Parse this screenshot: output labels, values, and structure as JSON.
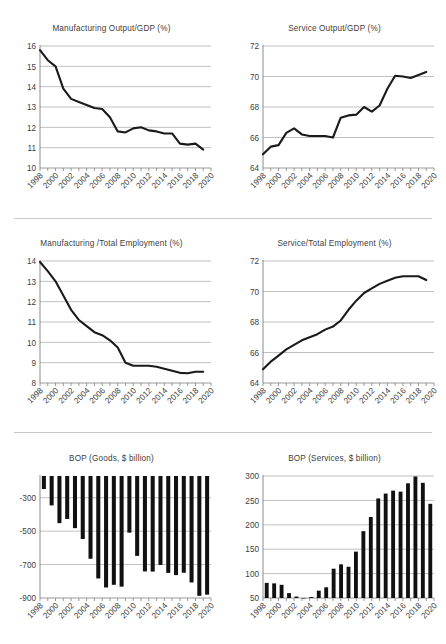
{
  "document": {
    "kind": "figure-panel",
    "panel_count": 6,
    "background_color": "#ffffff",
    "line_color": "#1a1a1a",
    "bar_color": "#111111",
    "grid_color": "#b0b0b0",
    "axis_color": "#808080",
    "text_color": "#404040"
  },
  "charts": [
    {
      "id": "manufacturing-output-gdp",
      "chart_data": {
        "type": "line",
        "title": "Manufacturing Output/GDP (%)",
        "xlabel": "",
        "ylabel": "",
        "ylim": [
          10,
          16
        ],
        "yticks": [
          10,
          11,
          12,
          13,
          14,
          15,
          16
        ],
        "ytick_labels": [
          "10",
          "11",
          "12",
          "13",
          "14",
          "15",
          "16"
        ],
        "xlim": [
          1998,
          2020
        ],
        "xticks": [
          1998,
          2000,
          2002,
          2004,
          2006,
          2008,
          2010,
          2012,
          2014,
          2016,
          2018,
          2020
        ],
        "xtick_labels": [
          "1998",
          "2000",
          "2002",
          "2004",
          "2006",
          "2008",
          "2010",
          "2012",
          "2014",
          "2016",
          "2018",
          "2020"
        ],
        "grid": "horizontal",
        "legend": "none",
        "x": [
          1998,
          1999,
          2000,
          2001,
          2002,
          2003,
          2004,
          2005,
          2006,
          2007,
          2008,
          2009,
          2010,
          2011,
          2012,
          2013,
          2014,
          2015,
          2016,
          2017,
          2018,
          2019
        ],
        "values": [
          15.8,
          15.3,
          15.0,
          13.9,
          13.4,
          13.25,
          13.1,
          12.95,
          12.9,
          12.5,
          11.8,
          11.75,
          11.95,
          12.0,
          11.85,
          11.8,
          11.7,
          11.7,
          11.2,
          11.15,
          11.2,
          10.9
        ]
      }
    },
    {
      "id": "service-output-gdp",
      "chart_data": {
        "type": "line",
        "title": "Service Output/GDP (%)",
        "xlabel": "",
        "ylabel": "",
        "ylim": [
          64,
          72
        ],
        "yticks": [
          64,
          66,
          68,
          70,
          72
        ],
        "ytick_labels": [
          "64",
          "66",
          "68",
          "70",
          "72"
        ],
        "xlim": [
          1998,
          2020
        ],
        "xticks": [
          1998,
          2000,
          2002,
          2004,
          2006,
          2008,
          2010,
          2012,
          2014,
          2016,
          2018,
          2020
        ],
        "xtick_labels": [
          "1998",
          "2000",
          "2002",
          "2004",
          "2006",
          "2008",
          "2010",
          "2012",
          "2014",
          "2016",
          "2018",
          "2020"
        ],
        "grid": "horizontal",
        "legend": "none",
        "x": [
          1998,
          1999,
          2000,
          2001,
          2002,
          2003,
          2004,
          2005,
          2006,
          2007,
          2008,
          2009,
          2010,
          2011,
          2012,
          2013,
          2014,
          2015,
          2016,
          2017,
          2018,
          2019
        ],
        "values": [
          64.9,
          65.4,
          65.5,
          66.3,
          66.6,
          66.2,
          66.1,
          66.1,
          66.1,
          66.0,
          67.3,
          67.45,
          67.5,
          68.0,
          67.7,
          68.1,
          69.2,
          70.05,
          70.0,
          69.9,
          70.1,
          70.3
        ]
      }
    },
    {
      "id": "manufacturing-total-employment",
      "chart_data": {
        "type": "line",
        "title": "Manufacturing /Total Employment (%)",
        "xlabel": "",
        "ylabel": "",
        "ylim": [
          8,
          14
        ],
        "yticks": [
          8,
          9,
          10,
          11,
          12,
          13,
          14
        ],
        "ytick_labels": [
          "8",
          "9",
          "10",
          "11",
          "12",
          "13",
          "14"
        ],
        "xlim": [
          1998,
          2020
        ],
        "xticks": [
          1998,
          2000,
          2002,
          2004,
          2006,
          2008,
          2010,
          2012,
          2014,
          2016,
          2018,
          2020
        ],
        "xtick_labels": [
          "1998",
          "2000",
          "2002",
          "2004",
          "2006",
          "2008",
          "2010",
          "2012",
          "2014",
          "2016",
          "2018",
          "2020"
        ],
        "grid": "horizontal",
        "legend": "none",
        "x": [
          1998,
          1999,
          2000,
          2001,
          2002,
          2003,
          2004,
          2005,
          2006,
          2007,
          2008,
          2009,
          2010,
          2011,
          2012,
          2013,
          2014,
          2015,
          2016,
          2017,
          2018,
          2019
        ],
        "values": [
          13.95,
          13.5,
          13.0,
          12.3,
          11.6,
          11.1,
          10.8,
          10.5,
          10.35,
          10.1,
          9.75,
          9.0,
          8.85,
          8.85,
          8.85,
          8.8,
          8.7,
          8.6,
          8.5,
          8.48,
          8.55,
          8.55
        ]
      }
    },
    {
      "id": "service-total-employment",
      "chart_data": {
        "type": "line",
        "title": "Service/Total Employment (%)",
        "xlabel": "",
        "ylabel": "",
        "ylim": [
          64,
          72
        ],
        "yticks": [
          64,
          66,
          68,
          70,
          72
        ],
        "ytick_labels": [
          "64",
          "66",
          "68",
          "70",
          "72"
        ],
        "xlim": [
          1998,
          2020
        ],
        "xticks": [
          1998,
          2000,
          2002,
          2004,
          2006,
          2008,
          2010,
          2012,
          2014,
          2016,
          2018,
          2020
        ],
        "xtick_labels": [
          "1998",
          "2000",
          "2002",
          "2004",
          "2006",
          "2008",
          "2010",
          "2012",
          "2014",
          "2016",
          "2018",
          "2020"
        ],
        "grid": "horizontal",
        "legend": "none",
        "x": [
          1998,
          1999,
          2000,
          2001,
          2002,
          2003,
          2004,
          2005,
          2006,
          2007,
          2008,
          2009,
          2010,
          2011,
          2012,
          2013,
          2014,
          2015,
          2016,
          2017,
          2018,
          2019
        ],
        "values": [
          64.9,
          65.4,
          65.8,
          66.2,
          66.5,
          66.8,
          67.0,
          67.2,
          67.5,
          67.7,
          68.1,
          68.8,
          69.4,
          69.9,
          70.2,
          70.5,
          70.7,
          70.9,
          71.0,
          71.0,
          71.0,
          70.75
        ]
      }
    },
    {
      "id": "bop-goods",
      "chart_data": {
        "type": "bar",
        "title": "BOP (Goods, $ billion)",
        "xlabel": "",
        "ylabel": "",
        "ylim": [
          -900,
          -170
        ],
        "yticks": [
          -900,
          -700,
          -500,
          -300
        ],
        "ytick_labels": [
          "-900",
          "-700",
          "-500",
          "-300"
        ],
        "grid": "horizontal",
        "legend": "none",
        "categories": [
          "1998",
          "1999",
          "2000",
          "2001",
          "2002",
          "2003",
          "2004",
          "2005",
          "2006",
          "2007",
          "2008",
          "2009",
          "2010",
          "2011",
          "2012",
          "2013",
          "2014",
          "2015",
          "2016",
          "2017",
          "2018",
          "2019"
        ],
        "xtick_labels": [
          "1998",
          "2000",
          "2002",
          "2004",
          "2006",
          "2008",
          "2010",
          "2012",
          "2014",
          "2016",
          "2018",
          "2020"
        ],
        "values": [
          -248,
          -346,
          -452,
          -427,
          -482,
          -547,
          -665,
          -783,
          -837,
          -821,
          -832,
          -509,
          -648,
          -741,
          -742,
          -702,
          -750,
          -763,
          -749,
          -807,
          -887,
          -880
        ]
      }
    },
    {
      "id": "bop-services",
      "chart_data": {
        "type": "bar",
        "title": "BOP (Services, $ billion)",
        "xlabel": "",
        "ylabel": "",
        "ylim": [
          50,
          300
        ],
        "yticks": [
          50,
          100,
          150,
          200,
          250,
          300
        ],
        "ytick_labels": [
          "50",
          "100",
          "150",
          "200",
          "250",
          "300"
        ],
        "grid": "horizontal",
        "legend": "none",
        "categories": [
          "1998",
          "1999",
          "2000",
          "2001",
          "2002",
          "2003",
          "2004",
          "2005",
          "2006",
          "2007",
          "2008",
          "2009",
          "2010",
          "2011",
          "2012",
          "2013",
          "2014",
          "2015",
          "2016",
          "2017",
          "2018",
          "2019"
        ],
        "xtick_labels": [
          "1998",
          "2000",
          "2002",
          "2004",
          "2006",
          "2008",
          "2010",
          "2012",
          "2014",
          "2016",
          "2018",
          "2020"
        ],
        "values": [
          81,
          80,
          77,
          60,
          53,
          50,
          52,
          65,
          72,
          110,
          119,
          114,
          145,
          187,
          216,
          254,
          264,
          270,
          268,
          285,
          299,
          286,
          243
        ]
      }
    }
  ]
}
